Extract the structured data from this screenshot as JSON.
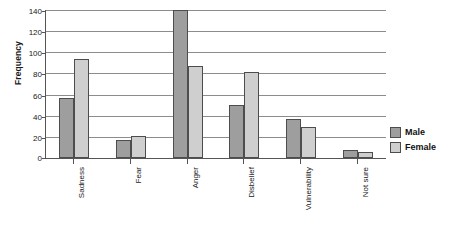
{
  "chart_data": {
    "type": "bar",
    "title": "",
    "xlabel": "",
    "ylabel": "Frequency",
    "ylim": [
      0,
      140
    ],
    "yticks": [
      0,
      20,
      40,
      60,
      80,
      100,
      120,
      140
    ],
    "grid": true,
    "legend_position": "right",
    "categories": [
      "Sadness",
      "Fear",
      "Anger",
      "Disbelief",
      "Vulnerability",
      "Not sure"
    ],
    "series": [
      {
        "name": "Male",
        "color": "#9e9e9e",
        "values": [
          57,
          17,
          140,
          50,
          37,
          8
        ]
      },
      {
        "name": "Female",
        "color": "#cfcfcf",
        "values": [
          94,
          21,
          87,
          81,
          29,
          6
        ]
      }
    ]
  },
  "legend": {
    "items": [
      {
        "label": "Male"
      },
      {
        "label": "Female"
      }
    ]
  }
}
